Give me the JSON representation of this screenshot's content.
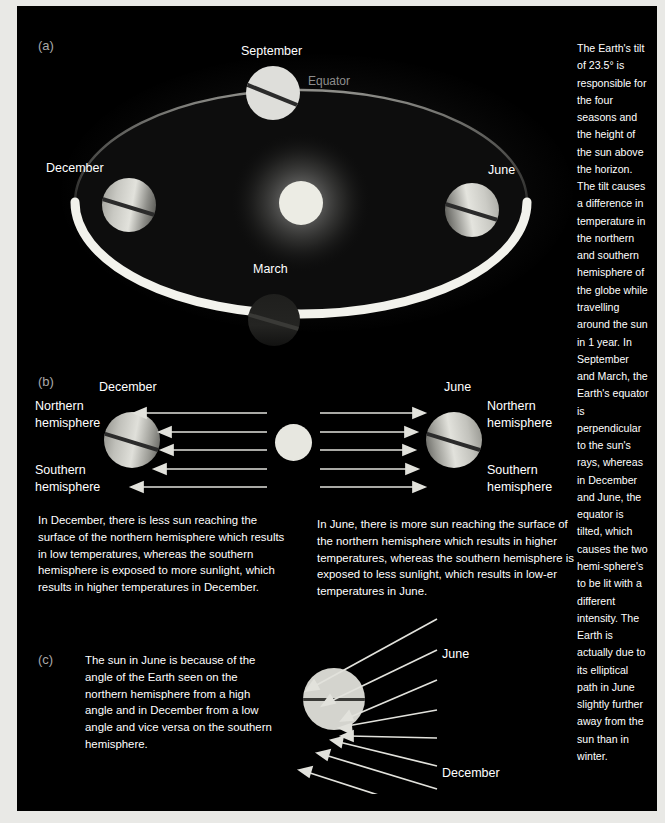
{
  "figure": {
    "background_color": "#000000",
    "text_color": "#ffffff",
    "dim_text_color": "#8e8e8e",
    "globe_color": "#d9d9d2",
    "sun_color": "#e7e7e0"
  },
  "panel_a": {
    "id": "(a)",
    "labels": {
      "september": "September",
      "december": "December",
      "june": "June",
      "march": "March",
      "equator": "Equator"
    }
  },
  "panel_b": {
    "id": "(b)",
    "left": {
      "month": "December",
      "northern": "Northern\nhemisphere",
      "southern": "Southern\nhemisphere",
      "caption": "In December, there is less sun reaching the surface of the northern hemisphere which results in low temperatures, whereas the southern hemisphere is exposed to more sunlight, which results in higher temperatures in December."
    },
    "right": {
      "month": "June",
      "northern": "Northern\nhemisphere",
      "southern": "Southern\nhemisphere",
      "caption": "In June, there is more sun reaching the surface of the northern hemisphere which results in higher temperatures, whereas the southern hemisphere is exposed to less sunlight, which results in low-er temperatures in June."
    }
  },
  "panel_c": {
    "id": "(c)",
    "caption": "The sun in June is because of the angle of the Earth seen on the northern hemisphere from a high angle and in December from a low angle and vice versa on the southern hemisphere.",
    "labels": {
      "june": "June",
      "december": "December"
    }
  },
  "sidebar": {
    "text": "The Earth's tilt of 23.5° is responsible for the four seasons and the height of the sun above the horizon. The tilt causes a difference in temperature in the northern and southern hemisphere of the globe while travelling around the sun in 1 year. In September and March, the Earth's equator is perpendicular to the sun's rays, whereas in December and June, the equator is tilted, which causes the two hemi-sphere's to be lit with a different intensity. The Earth is actually due to its elliptical path in June slightly further away from the sun than in winter."
  }
}
